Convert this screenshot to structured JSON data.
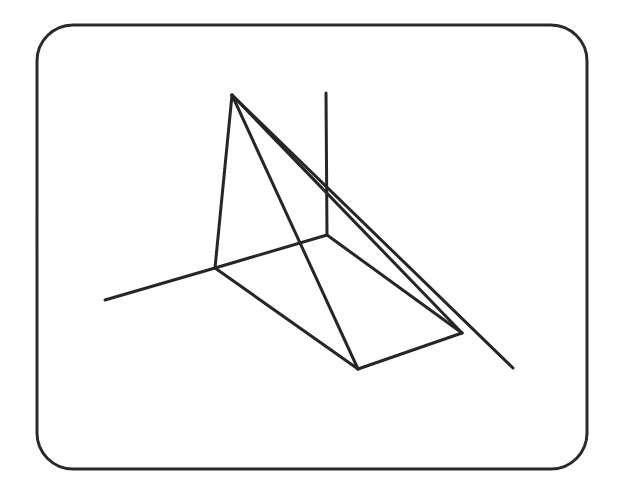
{
  "figure": {
    "frame": {
      "x": 37,
      "y": 25,
      "width": 550,
      "height": 444,
      "radius": 36,
      "stroke": "#2a2a2a"
    },
    "stroke_color": "#262626",
    "points": {
      "apex": [
        232,
        95
      ],
      "A": [
        215,
        268
      ],
      "B": [
        327,
        235
      ],
      "C": [
        358,
        369
      ],
      "D": [
        462,
        333
      ],
      "axis_left_end": [
        105,
        300
      ],
      "vertical_top": [
        326,
        93
      ],
      "diagonal_end": [
        513,
        368
      ]
    },
    "edges": [
      {
        "name": "axis-left",
        "from": "A",
        "to": "axis_left_end"
      },
      {
        "name": "vertical-axis",
        "from": "vertical_top",
        "to": "B"
      },
      {
        "name": "apex-to-A",
        "from": "apex",
        "to": "A"
      },
      {
        "name": "apex-to-C",
        "from": "apex",
        "to": "C"
      },
      {
        "name": "apex-to-D",
        "from": "apex",
        "to": "D"
      },
      {
        "name": "apex-long-diagonal",
        "from": "apex",
        "to": "diagonal_end"
      },
      {
        "name": "A-to-B",
        "from": "A",
        "to": "B"
      },
      {
        "name": "A-to-C",
        "from": "A",
        "to": "C"
      },
      {
        "name": "C-to-D",
        "from": "C",
        "to": "D"
      },
      {
        "name": "B-to-D",
        "from": "B",
        "to": "D"
      }
    ]
  }
}
